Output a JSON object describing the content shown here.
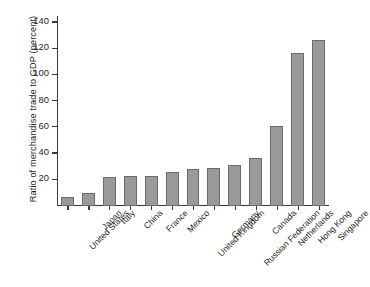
{
  "chart_data": {
    "type": "bar",
    "title": "",
    "xlabel": "",
    "ylabel": "Ratio of merchandise trade to GDP (percent)",
    "ylim": [
      0,
      145
    ],
    "yticks": [
      20,
      40,
      60,
      80,
      100,
      120,
      140
    ],
    "grid": false,
    "legend": null,
    "categories": [
      "United States",
      "Japan",
      "Italy",
      "China",
      "France",
      "Mexico",
      "United Kingdom",
      "Germany",
      "Russian Federation",
      "Canada",
      "Netherlands",
      "Hong Kong",
      "Singapore"
    ],
    "values": [
      7,
      10,
      22,
      23,
      23,
      26,
      28,
      29,
      31,
      37,
      61,
      117,
      127
    ],
    "bar_color": "#9a9a9a",
    "bar_edge_color": "#6b6b6b",
    "axis_color": "#3a3a3a",
    "background": "#ffffff"
  }
}
